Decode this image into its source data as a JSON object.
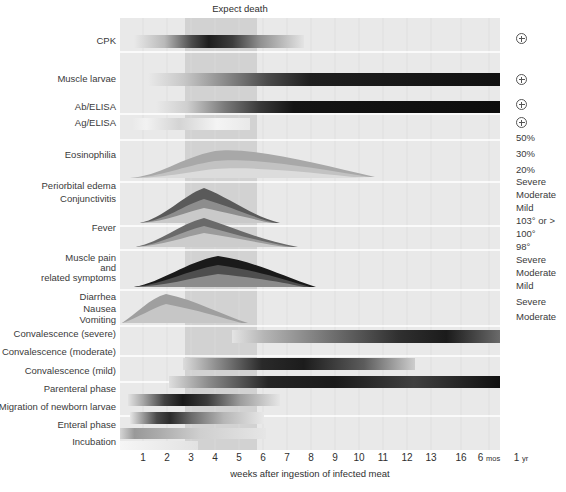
{
  "annotation": {
    "expect_death": "Expect death"
  },
  "axis": {
    "title": "weeks after ingestion of infected meat",
    "ticks": [
      {
        "label": "1",
        "x": 143
      },
      {
        "label": "2",
        "x": 167
      },
      {
        "label": "3",
        "x": 191
      },
      {
        "label": "4",
        "x": 215
      },
      {
        "label": "5",
        "x": 239
      },
      {
        "label": "6",
        "x": 263
      },
      {
        "label": "7",
        "x": 287
      },
      {
        "label": "8",
        "x": 311
      },
      {
        "label": "9",
        "x": 335
      },
      {
        "label": "10",
        "x": 359
      },
      {
        "label": "11",
        "x": 383
      },
      {
        "label": "12",
        "x": 407
      },
      {
        "label": "13",
        "x": 431
      },
      {
        "label": "16",
        "x": 461
      },
      {
        "label": "6 mos",
        "x": 489
      },
      {
        "label": "1 yr",
        "x": 521
      }
    ]
  },
  "rows": [
    {
      "name": "cpk",
      "label": "CPK",
      "y": 41
    },
    {
      "name": "muscle-larvae",
      "label": "Muscle larvae",
      "y": 79
    },
    {
      "name": "ab-elisa",
      "label": "Ab/ELISA",
      "y": 107
    },
    {
      "name": "ag-elisa",
      "label": "Ag/ELISA",
      "y": 123
    },
    {
      "name": "eosinophilia",
      "label": "Eosinophilia",
      "y": 155
    },
    {
      "name": "periorbital-edema",
      "label": "Periorbital edema",
      "y": 186
    },
    {
      "name": "conjunctivitis",
      "label": "Conjunctivitis",
      "y": 199
    },
    {
      "name": "fever",
      "label": "Fever",
      "y": 228
    },
    {
      "name": "muscle-pain",
      "label": "Muscle pain",
      "y": 258
    },
    {
      "name": "muscle-pain-and",
      "label": "and",
      "y": 268
    },
    {
      "name": "muscle-pain-related",
      "label": "related symptoms",
      "y": 278
    },
    {
      "name": "diarrhea",
      "label": "Diarrhea",
      "y": 297
    },
    {
      "name": "nausea",
      "label": "Nausea",
      "y": 309
    },
    {
      "name": "vomiting",
      "label": "Vomiting",
      "y": 320
    },
    {
      "name": "convalescence-severe",
      "label": "Convalescence (severe)",
      "y": 334
    },
    {
      "name": "convalescence-moderate",
      "label": "Convalescence (moderate)",
      "y": 352
    },
    {
      "name": "convalescence-mild",
      "label": "Convalescence (mild)",
      "y": 371
    },
    {
      "name": "parenteral-phase",
      "label": "Parenteral phase",
      "y": 389
    },
    {
      "name": "migration-newborn-larvae",
      "label": "Migration of newborn larvae",
      "y": 407
    },
    {
      "name": "enteral-phase",
      "label": "Enteral phase",
      "y": 425
    },
    {
      "name": "incubation",
      "label": "Incubation",
      "y": 442
    }
  ],
  "right_labels": [
    {
      "name": "cpk-positive",
      "type": "plus",
      "label": "⊕",
      "y": 38
    },
    {
      "name": "muscle-larvae-positive",
      "type": "plus",
      "label": "⊕",
      "y": 79
    },
    {
      "name": "ab-elisa-positive",
      "type": "plus",
      "label": "⊕",
      "y": 104
    },
    {
      "name": "ag-elisa-positive",
      "type": "plus",
      "label": "⊕",
      "y": 122
    },
    {
      "name": "eosinophilia-50",
      "type": "text",
      "label": "50%",
      "y": 137
    },
    {
      "name": "eosinophilia-30",
      "type": "text",
      "label": "30%",
      "y": 153
    },
    {
      "name": "eosinophilia-20",
      "type": "text",
      "label": "20%",
      "y": 169
    },
    {
      "name": "edema-severe",
      "type": "text",
      "label": "Severe",
      "y": 181
    },
    {
      "name": "edema-moderate",
      "type": "text",
      "label": "Moderate",
      "y": 194
    },
    {
      "name": "edema-mild",
      "type": "text",
      "label": "Mild",
      "y": 207
    },
    {
      "name": "fever-103",
      "type": "text",
      "label": "103° or >",
      "y": 220
    },
    {
      "name": "fever-100",
      "type": "text",
      "label": "100°",
      "y": 233
    },
    {
      "name": "fever-98",
      "type": "text",
      "label": "98°",
      "y": 246
    },
    {
      "name": "muscle-pain-severe",
      "type": "text",
      "label": "Severe",
      "y": 259
    },
    {
      "name": "muscle-pain-moderate",
      "type": "text",
      "label": "Moderate",
      "y": 272
    },
    {
      "name": "muscle-pain-mild",
      "type": "text",
      "label": "Mild",
      "y": 285
    },
    {
      "name": "gi-severe",
      "type": "text",
      "label": "Severe",
      "y": 301
    },
    {
      "name": "gi-moderate",
      "type": "text",
      "label": "Moderate",
      "y": 316
    }
  ],
  "chart_data": {
    "type": "heatmap",
    "xlabel": "weeks after ingestion of infected meat",
    "ylabel": "",
    "grid": true,
    "legend_position": "right",
    "xlim": [
      0,
      14
    ],
    "x_tick_labels": [
      "1",
      "2",
      "3",
      "4",
      "5",
      "6",
      "7",
      "8",
      "9",
      "10",
      "11",
      "12",
      "13",
      "16",
      "6 mos",
      "1 yr"
    ],
    "expect_death_window_weeks": [
      3,
      6
    ],
    "series": [
      {
        "name": "CPK",
        "kind": "band",
        "onset_week": 1.3,
        "peak_week": 3.5,
        "end_week": 6.6,
        "intensity": "high",
        "marker": "+"
      },
      {
        "name": "Muscle larvae",
        "kind": "band",
        "onset_week": 1.6,
        "peak_week": 7,
        "end_week": 14,
        "intensity": "high",
        "marker": "+"
      },
      {
        "name": "Ab/ELISA",
        "kind": "band",
        "onset_week": 2.0,
        "peak_week": 7,
        "end_week": 14,
        "intensity": "high",
        "marker": "+"
      },
      {
        "name": "Ag/ELISA",
        "kind": "band",
        "onset_week": 1.0,
        "peak_week": 2.5,
        "end_week": 5.2,
        "intensity": "low",
        "marker": "+"
      },
      {
        "name": "Eosinophilia",
        "kind": "curve",
        "onset_week": 1.0,
        "peak_week": 4.0,
        "end_week": 9.6,
        "levels": [
          "50%",
          "30%",
          "20%"
        ]
      },
      {
        "name": "Periorbital edema / Conjunctivitis",
        "kind": "curve",
        "onset_week": 1.5,
        "peak_week": 3.6,
        "end_week": 7.0,
        "levels": [
          "Severe",
          "Moderate",
          "Mild"
        ]
      },
      {
        "name": "Fever",
        "kind": "curve",
        "onset_week": 1.4,
        "peak_week": 3.6,
        "end_week": 7.8,
        "levels": [
          "103° or >",
          "100°",
          "98°"
        ]
      },
      {
        "name": "Muscle pain and related symptoms",
        "kind": "curve",
        "onset_week": 1.3,
        "peak_week": 4.2,
        "end_week": 8.4,
        "levels": [
          "Severe",
          "Moderate",
          "Mild"
        ]
      },
      {
        "name": "Diarrhea / Nausea / Vomiting",
        "kind": "curve",
        "onset_week": 0.2,
        "peak_week": 2.0,
        "end_week": 5.8,
        "levels": [
          "Severe",
          "Moderate"
        ]
      },
      {
        "name": "Convalescence (severe)",
        "kind": "band",
        "onset_week": 5.6,
        "peak_week": 11.5,
        "end_week": 14,
        "intensity": "high"
      },
      {
        "name": "Convalescence (moderate)",
        "kind": "band",
        "onset_week": 3.6,
        "peak_week": 6.0,
        "end_week": 12.2,
        "intensity": "high"
      },
      {
        "name": "Convalescence (mild)",
        "kind": "band",
        "onset_week": 3.0,
        "peak_week": 5.8,
        "end_week": 14,
        "intensity": "high"
      },
      {
        "name": "Parenteral phase",
        "kind": "band",
        "onset_week": 1.0,
        "peak_week": 2.6,
        "end_week": 6.2,
        "intensity": "high"
      },
      {
        "name": "Migration of newborn larvae",
        "kind": "band",
        "onset_week": 1.1,
        "peak_week": 2.2,
        "end_week": 5.4,
        "intensity": "high"
      },
      {
        "name": "Enteral phase",
        "kind": "band",
        "onset_week": 0.0,
        "peak_week": 1.0,
        "end_week": 6.0,
        "intensity": "medium"
      },
      {
        "name": "Incubation",
        "kind": "band",
        "onset_week": 0.0,
        "peak_week": 0.5,
        "end_week": 3.0,
        "intensity": "low"
      }
    ]
  }
}
